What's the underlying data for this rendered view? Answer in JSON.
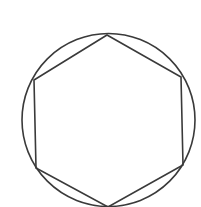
{
  "diagram": {
    "stroke_color": "#3a3a3a",
    "background_color": "#ffffff",
    "circle": {
      "cx": 108.5,
      "cy": 120,
      "r": 86.5
    },
    "hexagon": {
      "vertices": [
        [
          107,
          35
        ],
        [
          181,
          77
        ],
        [
          183,
          165
        ],
        [
          108,
          207
        ],
        [
          36,
          168
        ],
        [
          34,
          80
        ]
      ]
    }
  }
}
